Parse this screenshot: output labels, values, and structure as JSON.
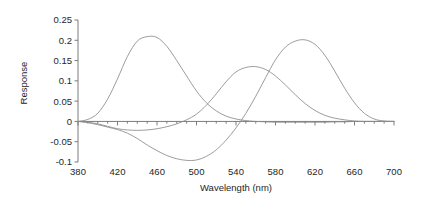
{
  "chart_data": {
    "type": "line",
    "title": "",
    "xlabel": "Wavelength (nm)",
    "ylabel": "Response",
    "xlim": [
      380,
      700
    ],
    "ylim": [
      -0.1,
      0.25
    ],
    "xticks": [
      380,
      420,
      460,
      500,
      540,
      580,
      620,
      660,
      700
    ],
    "yticks": [
      -0.1,
      -0.05,
      0,
      0.05,
      0.1,
      0.15,
      0.2,
      0.25
    ],
    "xtick_labels": [
      "380",
      "420",
      "460",
      "500",
      "540",
      "580",
      "620",
      "660",
      "700"
    ],
    "ytick_labels": [
      "-0.1",
      "-0.05",
      "0",
      "0.05",
      "0.1",
      "0.15",
      "0.2",
      "0.25"
    ],
    "x_minor_tick_step": 10,
    "grid": false,
    "legend": false,
    "legend_position": "none",
    "line_color": "#8a8a8a",
    "axis_color": "#6e6e6e",
    "background_color": "#ffffff",
    "x": [
      380,
      390,
      400,
      410,
      420,
      430,
      440,
      450,
      460,
      470,
      480,
      490,
      500,
      510,
      520,
      530,
      540,
      550,
      560,
      570,
      580,
      590,
      600,
      610,
      620,
      630,
      640,
      650,
      660,
      670,
      680,
      690,
      700
    ],
    "series": [
      {
        "name": "Curve 1 (blue-band, peak ~445 nm)",
        "peak_x": 445,
        "peak_y": 0.21,
        "values": [
          0.0,
          0.005,
          0.02,
          0.055,
          0.105,
          0.16,
          0.198,
          0.209,
          0.207,
          0.185,
          0.15,
          0.112,
          0.075,
          0.046,
          0.026,
          0.013,
          0.006,
          0.002,
          0.0,
          -0.001,
          -0.002,
          -0.002,
          -0.002,
          -0.002,
          -0.002,
          -0.002,
          -0.001,
          -0.001,
          0.0,
          0.0,
          0.0,
          0.0,
          0.0
        ]
      },
      {
        "name": "Curve 2 (green-band, peak ~535 nm)",
        "peak_x": 535,
        "peak_y": 0.135,
        "values": [
          0.0,
          -0.002,
          -0.006,
          -0.012,
          -0.018,
          -0.021,
          -0.022,
          -0.021,
          -0.018,
          -0.013,
          -0.006,
          0.004,
          0.018,
          0.04,
          0.068,
          0.098,
          0.122,
          0.133,
          0.135,
          0.128,
          0.112,
          0.09,
          0.066,
          0.044,
          0.027,
          0.015,
          0.008,
          0.004,
          0.001,
          0.0,
          0.0,
          0.0,
          0.0
        ]
      },
      {
        "name": "Curve 3 (red-band, peak ~605 nm, negative lobe ~520 nm)",
        "peak_x": 605,
        "peak_y": 0.201,
        "negative_min_x": 520,
        "negative_min_y": -0.095,
        "values": [
          0.0,
          -0.003,
          -0.008,
          -0.014,
          -0.02,
          -0.029,
          -0.042,
          -0.058,
          -0.072,
          -0.084,
          -0.092,
          -0.096,
          -0.095,
          -0.086,
          -0.07,
          -0.046,
          -0.016,
          0.02,
          0.062,
          0.108,
          0.152,
          0.183,
          0.198,
          0.201,
          0.19,
          0.163,
          0.124,
          0.082,
          0.046,
          0.02,
          0.006,
          0.001,
          0.0
        ]
      }
    ]
  }
}
